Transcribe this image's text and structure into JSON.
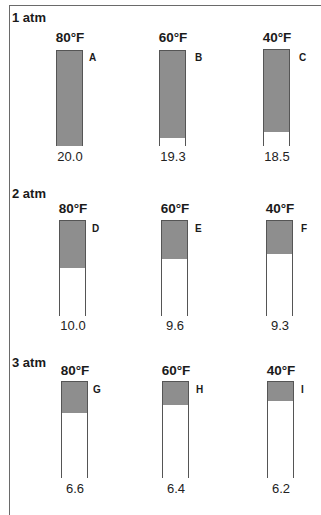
{
  "rows": [
    {
      "pressure": "1 atm",
      "cylinders": [
        {
          "temp": "80°F",
          "letter": "A",
          "volume": "20.0",
          "fill_fraction": 1.0
        },
        {
          "temp": "60°F",
          "letter": "B",
          "volume": "19.3",
          "fill_fraction": 0.905
        },
        {
          "temp": "40°F",
          "letter": "C",
          "volume": "18.5",
          "fill_fraction": 0.85
        }
      ]
    },
    {
      "pressure": "2 atm",
      "cylinders": [
        {
          "temp": "80°F",
          "letter": "D",
          "volume": "10.0",
          "fill_fraction": 0.49
        },
        {
          "temp": "60°F",
          "letter": "E",
          "volume": "9.6",
          "fill_fraction": 0.4
        },
        {
          "temp": "40°F",
          "letter": "F",
          "volume": "9.3",
          "fill_fraction": 0.35
        }
      ]
    },
    {
      "pressure": "3 atm",
      "cylinders": [
        {
          "temp": "80°F",
          "letter": "G",
          "volume": "6.6",
          "fill_fraction": 0.33
        },
        {
          "temp": "60°F",
          "letter": "H",
          "volume": "6.4",
          "fill_fraction": 0.24
        },
        {
          "temp": "40°F",
          "letter": "I",
          "volume": "6.2",
          "fill_fraction": 0.2
        }
      ]
    }
  ],
  "colors": {
    "gas_fill": "#8e8e8e",
    "outline": "#555555"
  }
}
